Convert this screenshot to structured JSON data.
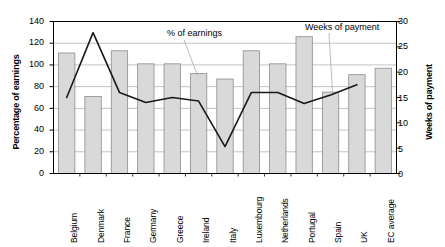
{
  "chart_data": {
    "type": "bar",
    "title": "",
    "subtitle": "",
    "categories": [
      "Belgium",
      "Denmark",
      "France",
      "Germany",
      "Greece",
      "Ireland",
      "Italy",
      "Luxembourg",
      "Netherlands",
      "Portugal",
      "Spain",
      "UK",
      "EC average"
    ],
    "xlabel": "",
    "ylabel": "Percentage of earnings",
    "ylabel_secondary": "Weeks of payment",
    "ylim": [
      0,
      140
    ],
    "ylim_secondary": [
      0,
      30
    ],
    "yticks": [
      0,
      20,
      40,
      60,
      80,
      100,
      120,
      140
    ],
    "yticks_secondary": [
      0,
      5,
      10,
      15,
      20,
      25,
      30
    ],
    "grid": true,
    "legend_position": "annotation-callouts",
    "series": [
      {
        "name": "% of earnings",
        "type": "bar",
        "axis": "left",
        "unit": "%",
        "values": [
          111,
          71,
          113,
          101,
          101,
          92,
          87,
          113,
          101,
          126,
          75,
          91,
          97
        ]
      },
      {
        "name": "Weeks of payment",
        "type": "line",
        "axis": "right",
        "unit": "weeks",
        "values": [
          15,
          27.8,
          16,
          14,
          15,
          14.3,
          5.3,
          16,
          16,
          13.8,
          15.5,
          17.5,
          null
        ]
      }
    ],
    "annotations": [
      {
        "name": "% of earnings",
        "text": "% of earnings",
        "points_to": "Ireland"
      },
      {
        "name": "Weeks of payment",
        "text": "Weeks of payment",
        "points_to": "Spain"
      }
    ]
  },
  "colors": {
    "bar_fill": "#d9d9d9",
    "bar_stroke": "#8c8c8c",
    "line_stroke": "#1a1a1a",
    "grid": "#b3b3b3",
    "axis": "#000000",
    "text": "#000000",
    "background": "#ffffff"
  },
  "axes": {
    "left": {
      "title": "Percentage of earnings",
      "ticks": [
        "0",
        "20",
        "40",
        "60",
        "80",
        "100",
        "120",
        "140"
      ]
    },
    "right": {
      "title": "Weeks of payment",
      "ticks": [
        "0",
        "5",
        "10",
        "15",
        "20",
        "25",
        "30"
      ]
    }
  },
  "annotations": {
    "earnings": "% of earnings",
    "weeks": "Weeks of payment"
  }
}
